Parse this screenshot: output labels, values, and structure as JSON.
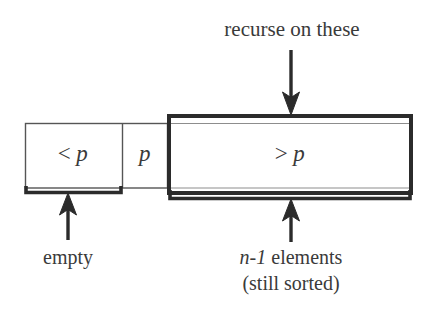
{
  "figure": {
    "title_text": "quicksort worst-case partition diagram",
    "background_color": "#ffffff",
    "ink_color": "#3a3a3a",
    "thick_stroke_color": "#2b2b2b"
  },
  "annotations": {
    "top_label": "recurse on these",
    "left_caption": "empty",
    "right_caption_line1_math": "n-1",
    "right_caption_line1_rest": " elements",
    "right_caption_line2": "(still sorted)"
  },
  "array_cells": [
    {
      "name": "less-than-pivot",
      "operator": "<",
      "variable": "p",
      "emphasis": "thin",
      "x": 25,
      "width": 97
    },
    {
      "name": "pivot",
      "operator": "",
      "variable": "p",
      "emphasis": "thin",
      "x": 122,
      "width": 46
    },
    {
      "name": "greater-than-pivot",
      "operator": ">",
      "variable": "p",
      "emphasis": "thick",
      "x": 168,
      "width": 244
    }
  ],
  "braces": [
    {
      "name": "empty-brace",
      "x1": 25,
      "x2": 122,
      "y": 192,
      "arrow_x": 68
    },
    {
      "name": "remaining-brace",
      "x1": 168,
      "x2": 412,
      "y": 198,
      "arrow_x": 291
    }
  ],
  "arrows": [
    {
      "name": "recurse-arrow",
      "direction": "down",
      "x": 291,
      "y1": 50,
      "y2": 112
    },
    {
      "name": "empty-arrow",
      "direction": "up",
      "x": 68,
      "y1": 238,
      "y2": 195
    },
    {
      "name": "remaining-arrow",
      "direction": "up",
      "x": 291,
      "y1": 240,
      "y2": 201
    }
  ]
}
